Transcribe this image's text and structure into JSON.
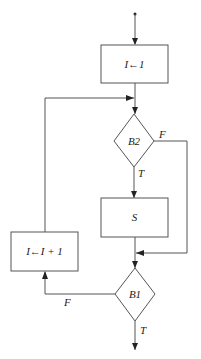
{
  "diagram": {
    "type": "flowchart",
    "nodes": {
      "init": {
        "label": "I←1",
        "shape": "rectangle"
      },
      "b2": {
        "label": "B2",
        "shape": "diamond"
      },
      "s": {
        "label": "S",
        "shape": "rectangle"
      },
      "inc": {
        "label": "I←I + 1",
        "shape": "rectangle"
      },
      "b1": {
        "label": "B1",
        "shape": "diamond"
      }
    },
    "edges": {
      "b2_false": "F",
      "b2_true": "T",
      "b1_false": "F",
      "b1_true": "T"
    },
    "colors": {
      "line": "#555555",
      "text": "#222222",
      "background": "#ffffff"
    }
  }
}
